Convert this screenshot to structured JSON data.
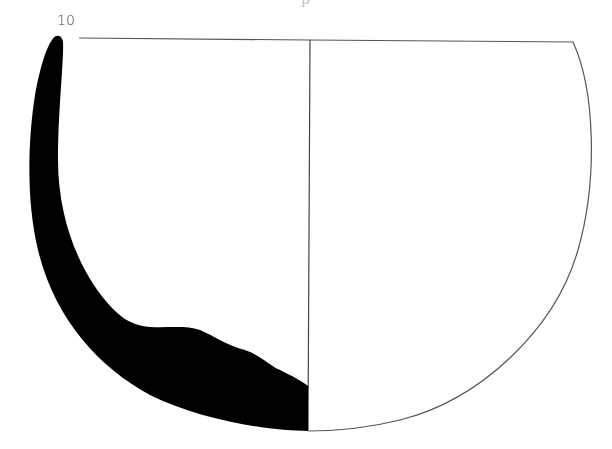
{
  "figure": {
    "number_label": "10",
    "caption_partial": "p",
    "type": "ceramic vessel profile drawing"
  },
  "colors": {
    "section_fill": "#000000",
    "outline": "#555555",
    "background": "#ffffff"
  }
}
